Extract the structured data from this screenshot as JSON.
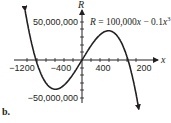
{
  "subfigure_label": "b.",
  "chart_data": {
    "type": "line",
    "title": "",
    "equation": "R = 100,000x − 0.1x³",
    "equation_parts": {
      "lhs": "R",
      "eq": " = 100,000",
      "x": "x",
      "minus": " − 0.1",
      "x2": "x",
      "exp": "3"
    },
    "xlabel": "x",
    "ylabel": "R",
    "x_ticks": [
      -1200,
      -800,
      -400,
      400,
      800,
      1200
    ],
    "x_tick_labels": [
      "−1200",
      "−400",
      "400",
      "1200"
    ],
    "x_tick_labels_shown": [
      "−1200",
      "−400",
      "400",
      "200"
    ],
    "y_tick_labels": [
      "50,000,000",
      "−50,000,000"
    ],
    "xlim": [
      -1300,
      1300
    ],
    "ylim": [
      -60000000,
      60000000
    ],
    "series": [
      {
        "name": "R = 100,000x − 0.1x³",
        "x": [
          -1300,
          -1200,
          -1000,
          -800,
          -577,
          -400,
          -200,
          0,
          200,
          400,
          577,
          800,
          1000,
          1200,
          1300
        ],
        "values": [
          89700000,
          52800000,
          0,
          -28800000,
          -38490000,
          -33600000,
          -19200000,
          0,
          19200000,
          33600000,
          38490000,
          28800000,
          0,
          -52800000,
          -89700000
        ]
      }
    ],
    "grid": false,
    "legend": "none"
  },
  "labels": {
    "y_axis": "R",
    "x_axis": "x",
    "y_top": "50,000,000",
    "y_bottom": "−50,000,000",
    "x_m1200": "−1200",
    "x_m400": "−400",
    "x_400": "400",
    "x_1200": "200"
  }
}
